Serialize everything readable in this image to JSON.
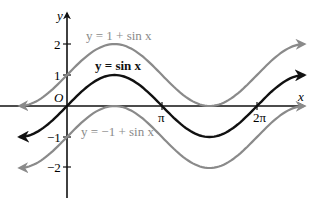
{
  "chart_data": {
    "type": "line",
    "title": "",
    "xlabel": "x",
    "ylabel": "y",
    "origin_label": "O",
    "x_ticks": [
      {
        "value": 3.14159,
        "label": "π"
      },
      {
        "value": 6.28318,
        "label": "2π"
      }
    ],
    "y_ticks": [
      {
        "value": 2,
        "label": "2"
      },
      {
        "value": 1,
        "label": "1"
      },
      {
        "value": -1,
        "label": "−1"
      },
      {
        "value": -2,
        "label": "−2"
      }
    ],
    "xlim": [
      -1.57,
      7.85
    ],
    "ylim": [
      -2.9,
      3.0
    ],
    "grid": false,
    "series": [
      {
        "name": "y = 1 + sin x",
        "expression": "1 + sin(x)",
        "color": "#8a8a8a",
        "domain": [
          -1.57,
          7.85
        ]
      },
      {
        "name": "y = sin x",
        "expression": "sin(x)",
        "color": "#111111",
        "domain": [
          -1.57,
          7.85
        ]
      },
      {
        "name": "y = −1 + sin x",
        "expression": "-1 + sin(x)",
        "color": "#8a8a8a",
        "domain": [
          -1.57,
          7.85
        ]
      }
    ],
    "annotations": [
      {
        "text": "y = 1 + sin x",
        "color": "#8a8a8a"
      },
      {
        "text": "y = sin x",
        "color": "#111111"
      },
      {
        "text": "y = −1 + sin x",
        "color": "#8a8a8a"
      }
    ]
  },
  "labels": {
    "x_axis": "x",
    "y_axis": "y",
    "origin": "O",
    "tick_pi": "π",
    "tick_2pi": "2π",
    "tick_y2": "2",
    "tick_y1": "1",
    "tick_ym1": "−1",
    "tick_ym2": "−2",
    "curve_upper": "y = 1 + sin x",
    "curve_mid": "y = sin x",
    "curve_lower": "y = −1 + sin x"
  },
  "colors": {
    "axis": "#111111",
    "sine": "#111111",
    "shifted": "#8a8a8a"
  }
}
